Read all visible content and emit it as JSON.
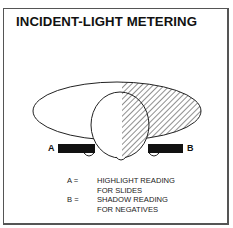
{
  "title": "INCIDENT-LIGHT METERING",
  "diagram": {
    "markers": [
      {
        "id": "A",
        "label": "A",
        "side": "left"
      },
      {
        "id": "B",
        "label": "B",
        "side": "right"
      }
    ],
    "shapes": {
      "light_ellipse": "large ellipse, right half hatched (shadow side)",
      "sphere": "incident-light dome, right half hatched",
      "bars": "meter bodies at positions A and B"
    }
  },
  "legend": [
    {
      "key": "A =",
      "line1": "HIGHLIGHT READING",
      "line2": "FOR SLIDES"
    },
    {
      "key": "B =",
      "line1": "SHADOW READING",
      "line2": "FOR NEGATIVES"
    }
  ],
  "colors": {
    "ink": "#111111",
    "frame": "#555555",
    "background": "#ffffff"
  }
}
